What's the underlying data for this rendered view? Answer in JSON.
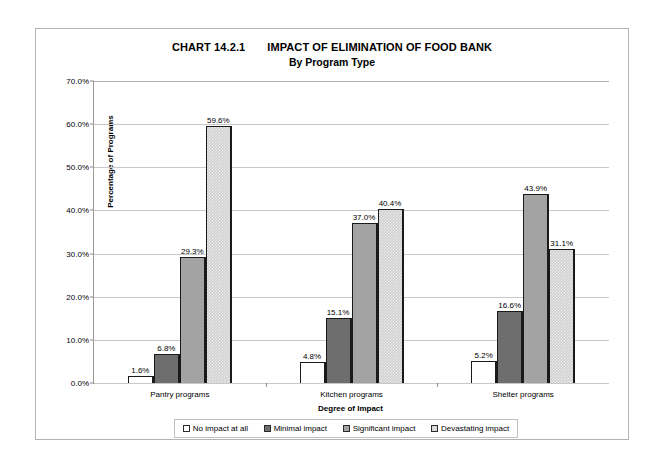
{
  "chart_data": {
    "type": "bar",
    "title": "IMPACT OF ELIMINATION OF FOOD BANK",
    "chart_number": "CHART 14.2.1",
    "subtitle": "By Program Type",
    "xlabel": "Degree of Impact",
    "ylabel": "Percentage of Programs",
    "categories": [
      "Pantry programs",
      "Kitchen programs",
      "Shelter programs"
    ],
    "series": [
      {
        "name": "No impact at all",
        "values": [
          1.6,
          4.8,
          5.2
        ],
        "labels": [
          "1.6%",
          "4.8%",
          "5.2%"
        ],
        "color": "#ffffff"
      },
      {
        "name": "Minimal impact",
        "values": [
          6.8,
          15.1,
          16.6
        ],
        "labels": [
          "6.8%",
          "15.1%",
          "16.6%"
        ],
        "color": "#6e6e6e"
      },
      {
        "name": "Significant impact",
        "values": [
          29.3,
          37.0,
          43.9
        ],
        "labels": [
          "29.3%",
          "37.0%",
          "43.9%"
        ],
        "color": "#a3a3a3"
      },
      {
        "name": "Devastating impact",
        "values": [
          59.6,
          40.4,
          31.1
        ],
        "labels": [
          "59.6%",
          "40.4%",
          "31.1%"
        ],
        "color": "#cfcfcf"
      }
    ],
    "ylim": [
      0,
      70
    ],
    "ytick_labels": [
      "0.0%",
      "10.0%",
      "20.0%",
      "30.0%",
      "40.0%",
      "50.0%",
      "60.0%",
      "70.0%"
    ],
    "ytick_values": [
      0,
      10,
      20,
      30,
      40,
      50,
      60,
      70
    ],
    "grid": true,
    "legend_position": "bottom"
  }
}
